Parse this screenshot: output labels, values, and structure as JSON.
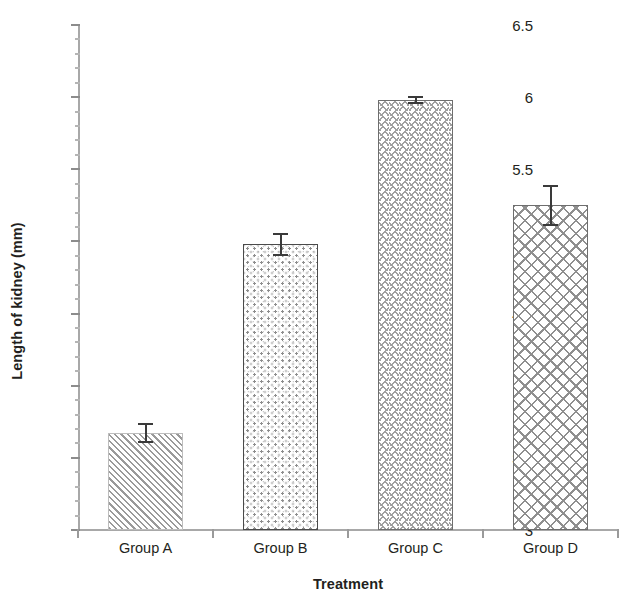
{
  "chart_data": {
    "type": "bar",
    "title": "",
    "xlabel": "Treatment",
    "ylabel": "Length of kidney (mm)",
    "categories": [
      "Group A",
      "Group B",
      "Group C",
      "Group D"
    ],
    "values": [
      3.67,
      4.98,
      5.98,
      5.25
    ],
    "errors": [
      0.07,
      0.08,
      0.03,
      0.14
    ],
    "series": [
      {
        "name": "Length of kidney (mm)",
        "values": [
          3.67,
          4.98,
          5.98,
          5.25
        ],
        "errors": [
          0.07,
          0.08,
          0.03,
          0.14
        ]
      }
    ],
    "ylim": [
      3,
      6.5
    ],
    "ytick_labels": [
      "3",
      "3.5",
      "4",
      "4.5",
      "5",
      "5.5",
      "6",
      "6.5"
    ],
    "ytick_values": [
      3,
      3.5,
      4,
      4.5,
      5,
      5.5,
      6,
      6.5
    ],
    "yminor_step": 0.1,
    "grid": false,
    "legend": "none",
    "bar_patterns": [
      "diagonal-hatch",
      "speckle",
      "zigzag",
      "crosshatch"
    ],
    "colors": {
      "axis": "#a8a8a8",
      "tick": "#8c8c8c",
      "text": "#231f20",
      "errorbar": "#3a3a3a",
      "bar_fill": "#ffffff",
      "bar_pattern": "#9a9a9a",
      "background": "#ffffff"
    }
  }
}
